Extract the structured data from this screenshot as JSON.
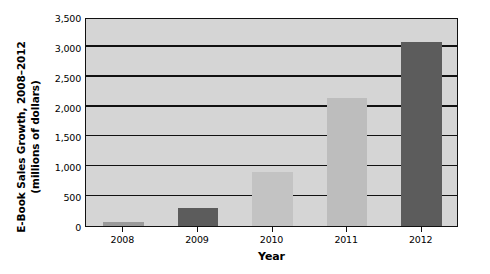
{
  "chart_data": {
    "type": "bar",
    "title": "",
    "categories": [
      "2008",
      "2009",
      "2010",
      "2011",
      "2012"
    ],
    "values": [
      70,
      300,
      900,
      2150,
      3080
    ],
    "series": [
      {
        "name": "E-Book Sales",
        "values": [
          70,
          300,
          900,
          2150,
          3080
        ]
      }
    ],
    "xlabel": "Year",
    "ylabel_line1": "E-Book Sales Growth, 2008–2012",
    "ylabel_line2": "(millions of dollars)",
    "ylabel": "E-Book Sales Growth, 2008–2012 (millions of dollars)",
    "ylim": [
      0,
      3500
    ],
    "ytick_values": [
      0,
      500,
      1000,
      1500,
      2000,
      2500,
      3000,
      3500
    ],
    "ytick_labels": [
      "0",
      "500",
      "1,000",
      "1,500",
      "2,000",
      "2,500",
      "3,000",
      "3,500"
    ],
    "grid": true,
    "legend": false,
    "bar_colors": [
      "#9a9a9a",
      "#5c5c5c",
      "#c3c3c3",
      "#bdbdbd",
      "#5c5c5c"
    ],
    "plot_background": "#d5d5d5",
    "axis_color": "#111111"
  }
}
